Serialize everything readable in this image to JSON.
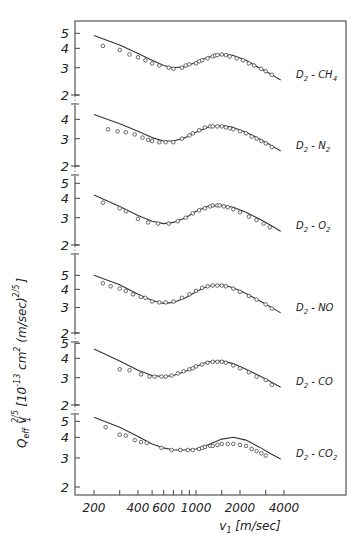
{
  "chart_data": {
    "type": "line",
    "layout": "stacked-panels-shared-x",
    "ylabel": "Q_eff v_1^(2/5) [10^-13 cm^2 (m/sec)^(2/5)]",
    "xlabel": "v_1 [m/sec]",
    "xscale": "log",
    "xlim": [
      150,
      6000
    ],
    "x_ticks": [
      200,
      300,
      400,
      500,
      600,
      700,
      800,
      900,
      1000,
      1500,
      2000,
      3000,
      4000
    ],
    "x_tick_labels": [
      "200",
      "400",
      "600",
      "1000",
      "2000",
      "4000"
    ],
    "x_tick_label_values": [
      200,
      400,
      600,
      1000,
      2000,
      4000
    ],
    "grid": false,
    "legend": "none",
    "series_style": {
      "theory": "solid line",
      "experiment": "open circles"
    },
    "panels": [
      {
        "label": "D2 - CH4",
        "label_main": "D",
        "label_sub1": "2",
        "label_mid": " - CH",
        "label_sub2": "4",
        "y_ticks": [
          2,
          3,
          4,
          5
        ],
        "yscale": "log",
        "theory": {
          "x": [
            200,
            300,
            400,
            500,
            600,
            700,
            850,
            1000,
            1200,
            1500,
            1800,
            2200,
            2700,
            3200,
            3800
          ],
          "y": [
            4.85,
            4.2,
            3.7,
            3.35,
            3.1,
            3.0,
            3.05,
            3.25,
            3.5,
            3.65,
            3.6,
            3.35,
            3.0,
            2.75,
            2.5
          ]
        },
        "experiment": {
          "x": [
            230,
            300,
            350,
            400,
            450,
            500,
            560,
            650,
            700,
            800,
            850,
            900,
            1000,
            1050,
            1100,
            1200,
            1300,
            1350,
            1400,
            1500,
            1600,
            1700,
            1900,
            2100,
            2300,
            2500,
            2800,
            3000,
            3300
          ],
          "y": [
            4.15,
            3.9,
            3.65,
            3.5,
            3.35,
            3.2,
            3.1,
            3.0,
            2.95,
            3.0,
            3.1,
            3.15,
            3.2,
            3.3,
            3.35,
            3.45,
            3.55,
            3.6,
            3.62,
            3.65,
            3.62,
            3.55,
            3.45,
            3.35,
            3.2,
            3.1,
            2.95,
            2.85,
            2.7
          ]
        },
        "y2_px": 95,
        "decade_px": 155
      },
      {
        "label": "D2 - N2",
        "label_main": "D",
        "label_sub1": "2",
        "label_mid": " - N",
        "label_sub2": "2",
        "y_ticks": [
          2,
          3,
          4
        ],
        "yscale": "log",
        "theory": {
          "x": [
            200,
            300,
            400,
            500,
            600,
            700,
            850,
            1000,
            1200,
            1500,
            1800,
            2200,
            2700,
            3200,
            3800
          ],
          "y": [
            4.3,
            3.75,
            3.35,
            3.05,
            2.9,
            2.9,
            3.05,
            3.3,
            3.55,
            3.65,
            3.55,
            3.3,
            3.0,
            2.75,
            2.5
          ]
        },
        "experiment": {
          "x": [
            250,
            290,
            330,
            380,
            430,
            470,
            500,
            560,
            620,
            700,
            800,
            900,
            950,
            1050,
            1150,
            1250,
            1300,
            1400,
            1500,
            1600,
            1700,
            1800,
            2000,
            2200,
            2400,
            2600,
            2800,
            3000,
            3300
          ],
          "y": [
            3.45,
            3.35,
            3.3,
            3.2,
            3.05,
            2.95,
            2.9,
            2.85,
            2.85,
            2.85,
            3.0,
            3.15,
            3.25,
            3.4,
            3.55,
            3.6,
            3.6,
            3.6,
            3.6,
            3.55,
            3.5,
            3.45,
            3.35,
            3.25,
            3.1,
            3.0,
            2.9,
            2.8,
            2.65
          ]
        },
        "y2_px": 166,
        "decade_px": 155
      },
      {
        "label": "D2 - O2",
        "label_main": "D",
        "label_sub1": "2",
        "label_mid": " - O",
        "label_sub2": "2",
        "y_ticks": [
          2,
          3,
          4,
          5
        ],
        "yscale": "log",
        "theory": {
          "x": [
            200,
            300,
            400,
            500,
            600,
            700,
            850,
            1000,
            1200,
            1500,
            1800,
            2200,
            2700,
            3200,
            3800
          ],
          "y": [
            4.2,
            3.55,
            3.1,
            2.85,
            2.75,
            2.8,
            3.0,
            3.3,
            3.55,
            3.6,
            3.5,
            3.25,
            2.95,
            2.7,
            2.45
          ]
        },
        "experiment": {
          "x": [
            230,
            300,
            330,
            400,
            470,
            550,
            650,
            750,
            850,
            950,
            1050,
            1150,
            1250,
            1300,
            1400,
            1450,
            1550,
            1650,
            1800,
            2000,
            2300,
            2600,
            2900,
            3200
          ],
          "y": [
            3.75,
            3.45,
            3.3,
            2.95,
            2.8,
            2.75,
            2.75,
            2.85,
            3.0,
            3.2,
            3.35,
            3.45,
            3.55,
            3.6,
            3.6,
            3.6,
            3.55,
            3.5,
            3.4,
            3.25,
            3.05,
            2.9,
            2.75,
            2.6
          ]
        },
        "y2_px": 245,
        "decade_px": 155
      },
      {
        "label": "D2 - NO",
        "label_main": "D",
        "label_sub1": "2",
        "label_mid": " - NO",
        "label_sub2": "",
        "y_ticks": [
          2,
          3,
          4,
          5
        ],
        "yscale": "log",
        "theory": {
          "x": [
            200,
            300,
            400,
            500,
            600,
            700,
            850,
            1000,
            1200,
            1500,
            1800,
            2200,
            2700,
            3200,
            3800
          ],
          "y": [
            5.0,
            4.3,
            3.7,
            3.35,
            3.2,
            3.25,
            3.5,
            3.85,
            4.2,
            4.3,
            4.1,
            3.75,
            3.35,
            3.05,
            2.75
          ]
        },
        "experiment": {
          "x": [
            230,
            260,
            300,
            330,
            370,
            420,
            450,
            500,
            560,
            620,
            700,
            800,
            900,
            1000,
            1100,
            1200,
            1300,
            1400,
            1500,
            1600,
            1800,
            2000,
            2300,
            2600,
            3000,
            3300
          ],
          "y": [
            4.4,
            4.2,
            4.05,
            3.9,
            3.7,
            3.55,
            3.5,
            3.3,
            3.25,
            3.25,
            3.3,
            3.5,
            3.7,
            3.9,
            4.1,
            4.2,
            4.25,
            4.25,
            4.25,
            4.2,
            4.05,
            3.85,
            3.6,
            3.4,
            3.15,
            2.95
          ]
        },
        "y2_px": 333,
        "decade_px": 145
      },
      {
        "label": "D2 - CO",
        "label_main": "D",
        "label_sub1": "2",
        "label_mid": " - CO",
        "label_sub2": "",
        "y_ticks": [
          2,
          3,
          4,
          5
        ],
        "yscale": "log",
        "theory": {
          "x": [
            200,
            300,
            400,
            500,
            600,
            700,
            850,
            1000,
            1200,
            1500,
            1800,
            2200,
            2700,
            3200,
            3800
          ],
          "y": [
            4.6,
            3.85,
            3.35,
            3.1,
            3.05,
            3.1,
            3.3,
            3.55,
            3.8,
            3.85,
            3.7,
            3.4,
            3.1,
            2.85,
            2.6
          ]
        },
        "experiment": {
          "x": [
            300,
            350,
            420,
            480,
            520,
            580,
            620,
            680,
            750,
            820,
            900,
            950,
            1000,
            1100,
            1200,
            1300,
            1400,
            1500,
            1600,
            1800,
            2000,
            2300,
            2600,
            3000,
            3300
          ],
          "y": [
            3.4,
            3.35,
            3.15,
            3.05,
            3.05,
            3.05,
            3.05,
            3.1,
            3.2,
            3.3,
            3.4,
            3.45,
            3.55,
            3.65,
            3.75,
            3.8,
            3.8,
            3.8,
            3.75,
            3.6,
            3.45,
            3.25,
            3.05,
            2.9,
            2.7
          ]
        },
        "y2_px": 405,
        "decade_px": 155
      },
      {
        "label": "D2 - CO2",
        "label_main": "D",
        "label_sub1": "2",
        "label_mid": " - CO",
        "label_sub2": "2",
        "y_ticks": [
          2,
          3,
          4,
          5
        ],
        "yscale": "log",
        "theory": {
          "x": [
            200,
            300,
            400,
            500,
            600,
            700,
            850,
            1000,
            1200,
            1500,
            1800,
            2200,
            2700,
            3200,
            3800
          ],
          "y": [
            5.3,
            4.6,
            4.05,
            3.65,
            3.45,
            3.35,
            3.35,
            3.4,
            3.6,
            3.9,
            4.0,
            3.85,
            3.5,
            3.2,
            2.95
          ]
        },
        "experiment": {
          "x": [
            240,
            300,
            330,
            380,
            420,
            460,
            580,
            680,
            780,
            880,
            950,
            1050,
            1100,
            1150,
            1250,
            1300,
            1400,
            1500,
            1650,
            1800,
            2000,
            2200,
            2400,
            2600,
            2800,
            3000
          ],
          "y": [
            4.6,
            4.15,
            4.1,
            3.85,
            3.75,
            3.7,
            3.45,
            3.35,
            3.35,
            3.35,
            3.35,
            3.4,
            3.45,
            3.5,
            3.55,
            3.55,
            3.6,
            3.65,
            3.65,
            3.65,
            3.6,
            3.55,
            3.4,
            3.3,
            3.2,
            3.1
          ]
        },
        "y2_px": 487,
        "decade_px": 165
      }
    ]
  },
  "axes": {
    "x_label_main": "v",
    "x_label_sub": "1",
    "x_label_unit": " [m/sec]",
    "y_label_q": "Q",
    "y_label_eff": "eff",
    "y_label_v": "v",
    "y_label_v_sup": "2/5",
    "y_label_v_sub": "1",
    "y_label_bracket": "[10",
    "y_label_exp": "-13",
    "y_label_cm": " cm",
    "y_label_cm_sup": "2",
    "y_label_unit": " (m/sec)",
    "y_label_unit_sup": "2/5",
    "y_label_close": "]"
  }
}
